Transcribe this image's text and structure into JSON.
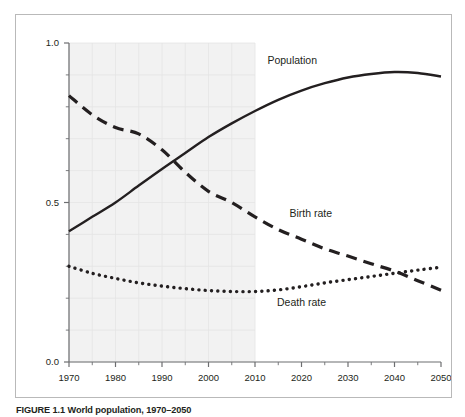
{
  "figure": {
    "caption_label": "FIGURE 1.1",
    "caption_text": "World population, 1970–2050",
    "caption_full": "FIGURE 1.1 World population, 1970–2050"
  },
  "chart_data": {
    "type": "line",
    "title": "World population, 1970–2050",
    "xlabel": "",
    "ylabel": "",
    "xlim": [
      1970,
      2050
    ],
    "ylim": [
      0.0,
      1.0
    ],
    "grid": true,
    "legend": "inline-labels",
    "x_ticks": [
      1970,
      1980,
      1990,
      2000,
      2010,
      2020,
      2030,
      2040,
      2050
    ],
    "x_tick_labels": [
      "1970",
      "1980",
      "1990",
      "2000",
      "2010",
      "2020",
      "2030",
      "2040",
      "2050"
    ],
    "x_minor_tick_interval": 5,
    "y_ticks": [
      0.0,
      0.5,
      1.0
    ],
    "y_tick_labels": [
      "0.0",
      "0.5",
      "1.0"
    ],
    "y_minor_tick_interval": 0.1,
    "shaded_region": {
      "label": "historical",
      "x_start": 1970,
      "x_end": 2010,
      "color": "#f2f2f2"
    },
    "x": [
      1970,
      1975,
      1980,
      1985,
      1990,
      1995,
      2000,
      2005,
      2010,
      2015,
      2020,
      2025,
      2030,
      2035,
      2040,
      2045,
      2050
    ],
    "series": [
      {
        "name": "Population",
        "label": "Population",
        "style": "solid",
        "color": "#231f20",
        "values": [
          0.41,
          0.455,
          0.5,
          0.553,
          0.605,
          0.655,
          0.705,
          0.748,
          0.787,
          0.822,
          0.851,
          0.874,
          0.892,
          0.903,
          0.909,
          0.906,
          0.895
        ]
      },
      {
        "name": "Birth rate",
        "label": "Birth rate",
        "style": "dashed",
        "color": "#231f20",
        "values": [
          0.835,
          0.775,
          0.735,
          0.715,
          0.665,
          0.595,
          0.535,
          0.5,
          0.455,
          0.415,
          0.385,
          0.355,
          0.332,
          0.308,
          0.285,
          0.255,
          0.225
        ]
      },
      {
        "name": "Death rate",
        "label": "Death rate",
        "style": "dotted",
        "color": "#231f20",
        "values": [
          0.3,
          0.278,
          0.262,
          0.248,
          0.238,
          0.23,
          0.224,
          0.221,
          0.221,
          0.226,
          0.236,
          0.248,
          0.258,
          0.268,
          0.278,
          0.288,
          0.297
        ]
      }
    ],
    "annotations": [
      {
        "text": "Population",
        "x": 2018,
        "y": 0.935
      },
      {
        "text": "Birth rate",
        "x": 2022,
        "y": 0.455
      },
      {
        "text": "Death rate",
        "x": 2020,
        "y": 0.175
      }
    ]
  }
}
